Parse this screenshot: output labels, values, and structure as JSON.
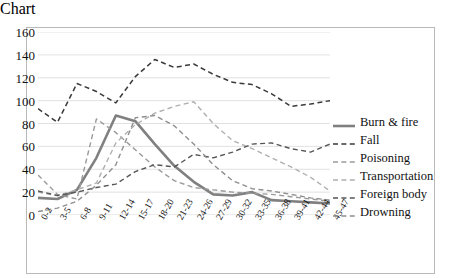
{
  "chart_data": {
    "type": "line",
    "title": "",
    "xlabel": "",
    "ylabel": "",
    "ylim": [
      0,
      160
    ],
    "ytick_step": 20,
    "yticks": [
      "160",
      "140",
      "120",
      "100",
      "80",
      "60",
      "40",
      "20",
      "0"
    ],
    "grid": true,
    "legend_position": "right",
    "categories": [
      "0-2",
      "3-5",
      "6-8",
      "9-11",
      "12-14",
      "15-17",
      "18-20",
      "21-23",
      "24-26",
      "27-29",
      "30-32",
      "33-35",
      "36-38",
      "39-41",
      "42-44",
      "45-47"
    ],
    "series": [
      {
        "name": "Burn & fire",
        "style": "solid",
        "color": "#808080",
        "width": 2.6,
        "values": [
          15,
          14,
          22,
          50,
          87,
          82,
          62,
          43,
          29,
          18,
          17,
          20,
          13,
          12,
          11,
          10
        ]
      },
      {
        "name": "Fall",
        "style": "dashed",
        "color": "#3a3a3a",
        "width": 1.5,
        "values": [
          93,
          81,
          115,
          108,
          98,
          121,
          136,
          129,
          132,
          123,
          116,
          114,
          106,
          95,
          97,
          100
        ]
      },
      {
        "name": "Poisoning",
        "style": "dashed",
        "color": "#9a9a9a",
        "width": 1.4,
        "values": [
          35,
          18,
          14,
          84,
          72,
          57,
          42,
          30,
          24,
          22,
          20,
          19,
          18,
          16,
          14,
          12
        ]
      },
      {
        "name": "Transportation",
        "style": "dashed",
        "color": "#b0b0b0",
        "width": 1.4,
        "values": [
          20,
          17,
          22,
          28,
          63,
          79,
          89,
          95,
          99,
          80,
          65,
          58,
          50,
          42,
          33,
          21
        ]
      },
      {
        "name": "Foreign body",
        "style": "dashed",
        "color": "#565656",
        "width": 1.4,
        "values": [
          21,
          17,
          20,
          24,
          27,
          38,
          44,
          42,
          53,
          50,
          55,
          62,
          63,
          58,
          55,
          62
        ]
      },
      {
        "name": "Drowning",
        "style": "dashed",
        "color": "#8f8f8f",
        "width": 1.4,
        "values": [
          3,
          6,
          12,
          26,
          44,
          85,
          87,
          78,
          62,
          44,
          30,
          23,
          21,
          18,
          15,
          13
        ]
      }
    ]
  }
}
